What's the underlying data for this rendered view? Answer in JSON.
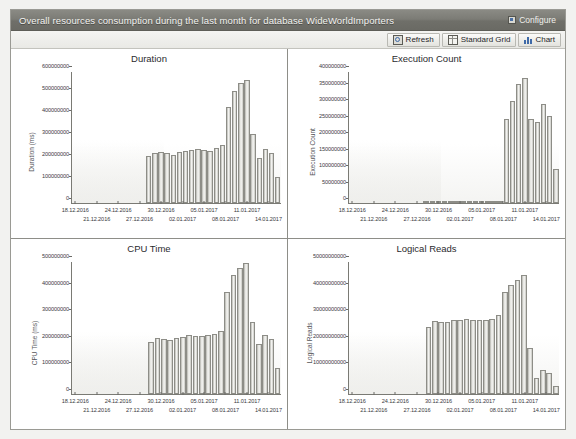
{
  "window": {
    "title": "Overall resources consumption during the last month for database WideWorldImporters",
    "configure_label": "Configure"
  },
  "toolbar": {
    "refresh_label": "Refresh",
    "standard_grid_label": "Standard Grid",
    "chart_label": "Chart"
  },
  "colors": {
    "titlebar": "#7c7c76",
    "bar_fill": "#e6e6e2",
    "bar_border": "#8d8d87",
    "axis": "#7a7a74",
    "panel_border": "#8e8e88"
  },
  "xaxis": {
    "labels_row0": [
      "18.12.2016",
      "24.12.2016",
      "30.12.2016",
      "05.01.2017",
      "11.01.2017"
    ],
    "labels_row1": [
      "21.12.2016",
      "27.12.2016",
      "02.01.2017",
      "08.01.2017",
      "14.01.2017"
    ],
    "all_labels": [
      "18.12.2016",
      "21.12.2016",
      "24.12.2016",
      "27.12.2016",
      "30.12.2016",
      "02.01.2017",
      "05.01.2017",
      "08.01.2017",
      "11.01.2017",
      "14.01.2017"
    ]
  },
  "chart_data": [
    {
      "type": "bar",
      "title": "Duration",
      "xlabel": "",
      "ylabel": "Duration (ms)",
      "ylim": [
        0,
        600000000
      ],
      "yticks": [
        0,
        100000000,
        200000000,
        300000000,
        400000000,
        500000000,
        600000000
      ],
      "ytick_labels": [
        "0",
        "100000000",
        "200000000",
        "300000000",
        "400000000",
        "500000000",
        "600000000"
      ],
      "grid": false,
      "legend": "none",
      "categories": [
        "18.12.2016",
        "19.12.2016",
        "20.12.2016",
        "21.12.2016",
        "22.12.2016",
        "23.12.2016",
        "24.12.2016",
        "25.12.2016",
        "26.12.2016",
        "27.12.2016",
        "28.12.2016",
        "29.12.2016",
        "30.12.2016",
        "31.12.2016",
        "01.01.2017",
        "02.01.2017",
        "03.01.2017",
        "04.01.2017",
        "05.01.2017",
        "06.01.2017",
        "07.01.2017",
        "08.01.2017",
        "09.01.2017",
        "10.01.2017",
        "11.01.2017",
        "12.01.2017",
        "13.01.2017",
        "14.01.2017",
        "15.01.2017",
        "16.01.2017",
        "17.01.2017"
      ],
      "values": [
        0,
        0,
        0,
        0,
        0,
        0,
        0,
        0,
        0,
        0,
        0,
        0,
        215000000,
        228000000,
        232000000,
        228000000,
        222000000,
        235000000,
        240000000,
        243000000,
        247000000,
        243000000,
        238000000,
        252000000,
        268000000,
        440000000,
        515000000,
        548000000,
        562000000,
        315000000,
        205000000,
        248000000,
        230000000,
        118000000
      ]
    },
    {
      "type": "bar",
      "title": "Execution Count",
      "xlabel": "",
      "ylabel": "Execution Count",
      "ylim": [
        0,
        400000000
      ],
      "yticks": [
        0,
        50000000,
        100000000,
        150000000,
        200000000,
        250000000,
        300000000,
        350000000,
        400000000
      ],
      "ytick_labels": [
        "0",
        "50000000",
        "100000000",
        "150000000",
        "200000000",
        "250000000",
        "300000000",
        "350000000",
        "400000000"
      ],
      "grid": false,
      "legend": "none",
      "categories": [
        "18.12.2016",
        "19.12.2016",
        "20.12.2016",
        "21.12.2016",
        "22.12.2016",
        "23.12.2016",
        "24.12.2016",
        "25.12.2016",
        "26.12.2016",
        "27.12.2016",
        "28.12.2016",
        "29.12.2016",
        "30.12.2016",
        "31.12.2016",
        "01.01.2017",
        "02.01.2017",
        "03.01.2017",
        "04.01.2017",
        "05.01.2017",
        "06.01.2017",
        "07.01.2017",
        "08.01.2017",
        "09.01.2017",
        "10.01.2017",
        "11.01.2017",
        "12.01.2017",
        "13.01.2017",
        "14.01.2017",
        "15.01.2017",
        "16.01.2017",
        "17.01.2017"
      ],
      "values": [
        0,
        0,
        0,
        0,
        0,
        0,
        0,
        0,
        0,
        0,
        0,
        0,
        6000000,
        6000000,
        6000000,
        6000000,
        6000000,
        6000000,
        6000000,
        6000000,
        6000000,
        6000000,
        6000000,
        6000000,
        6000000,
        258000000,
        312000000,
        362000000,
        383000000,
        256000000,
        246000000,
        303000000,
        265000000,
        103000000
      ]
    },
    {
      "type": "bar",
      "title": "CPU Time",
      "xlabel": "",
      "ylabel": "CPU Time (ms)",
      "ylim": [
        0,
        500000000
      ],
      "yticks": [
        0,
        100000000,
        200000000,
        300000000,
        400000000,
        500000000
      ],
      "ytick_labels": [
        "0",
        "100000000",
        "200000000",
        "300000000",
        "400000000",
        "500000000"
      ],
      "grid": false,
      "legend": "none",
      "categories": [
        "18.12.2016",
        "19.12.2016",
        "20.12.2016",
        "21.12.2016",
        "22.12.2016",
        "23.12.2016",
        "24.12.2016",
        "25.12.2016",
        "26.12.2016",
        "27.12.2016",
        "28.12.2016",
        "29.12.2016",
        "30.12.2016",
        "31.12.2016",
        "01.01.2017",
        "02.01.2017",
        "03.01.2017",
        "04.01.2017",
        "05.01.2017",
        "06.01.2017",
        "07.01.2017",
        "08.01.2017",
        "09.01.2017",
        "10.01.2017",
        "11.01.2017",
        "12.01.2017",
        "13.01.2017",
        "14.01.2017",
        "15.01.2017",
        "16.01.2017",
        "17.01.2017"
      ],
      "values": [
        0,
        0,
        0,
        0,
        0,
        0,
        0,
        0,
        0,
        0,
        0,
        0,
        196000000,
        212000000,
        210000000,
        205000000,
        214000000,
        216000000,
        222000000,
        220000000,
        221000000,
        224000000,
        228000000,
        238000000,
        386000000,
        450000000,
        476000000,
        498000000,
        272000000,
        190000000,
        225000000,
        208000000,
        98000000
      ]
    },
    {
      "type": "bar",
      "title": "Logical Reads",
      "xlabel": "",
      "ylabel": "Logical Reads",
      "ylim": [
        0,
        50000000000
      ],
      "yticks": [
        0,
        10000000000,
        20000000000,
        30000000000,
        40000000000,
        50000000000
      ],
      "ytick_labels": [
        "0",
        "10000000000",
        "20000000000",
        "30000000000",
        "40000000000",
        "50000000000"
      ],
      "grid": false,
      "legend": "none",
      "categories": [
        "18.12.2016",
        "19.12.2016",
        "20.12.2016",
        "21.12.2016",
        "22.12.2016",
        "23.12.2016",
        "24.12.2016",
        "25.12.2016",
        "26.12.2016",
        "27.12.2016",
        "28.12.2016",
        "29.12.2016",
        "30.12.2016",
        "31.12.2016",
        "01.01.2017",
        "02.01.2017",
        "03.01.2017",
        "04.01.2017",
        "05.01.2017",
        "06.01.2017",
        "07.01.2017",
        "08.01.2017",
        "09.01.2017",
        "10.01.2017",
        "11.01.2017",
        "12.01.2017",
        "13.01.2017",
        "14.01.2017",
        "15.01.2017",
        "16.01.2017",
        "17.01.2017"
      ],
      "values": [
        0,
        0,
        0,
        0,
        0,
        0,
        0,
        0,
        0,
        0,
        0,
        0,
        25500000000,
        27600000000,
        27200000000,
        27100000000,
        28000000000,
        28200000000,
        28300000000,
        28200000000,
        28000000000,
        28100000000,
        28600000000,
        30000000000,
        38800000000,
        41200000000,
        43200000000,
        45000000000,
        17500000000,
        6000000000,
        9000000000,
        7800000000,
        3000000000
      ]
    }
  ]
}
